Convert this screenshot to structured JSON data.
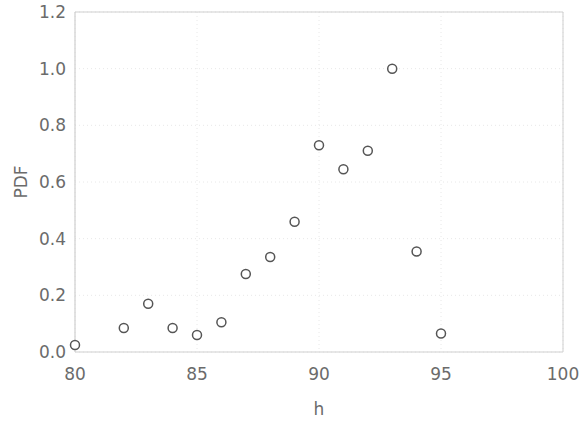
{
  "chart_data": {
    "type": "scatter",
    "title": "",
    "xlabel": "h",
    "ylabel": "PDF",
    "xlim": [
      80,
      100
    ],
    "ylim": [
      0.0,
      1.2
    ],
    "xticks": [
      80,
      85,
      90,
      95,
      100
    ],
    "yticks": [
      "0.0",
      "0.2",
      "0.4",
      "0.6",
      "0.8",
      "1.0",
      "1.2"
    ],
    "xtick_values": [
      80,
      85,
      90,
      95,
      100
    ],
    "ytick_values": [
      0.0,
      0.2,
      0.4,
      0.6,
      0.8,
      1.0,
      1.2
    ],
    "grid": true,
    "grid_style": "dotted",
    "legend": null,
    "marker": "open-circle",
    "marker_color": "#555555",
    "marker_fill": "#ffffff",
    "marker_size": 9,
    "x": [
      80,
      82,
      83,
      84,
      85,
      86,
      87,
      88,
      89,
      90,
      91,
      92,
      93,
      94,
      95
    ],
    "y": [
      0.025,
      0.085,
      0.17,
      0.085,
      0.06,
      0.105,
      0.275,
      0.335,
      0.46,
      0.73,
      0.645,
      0.71,
      1.0,
      0.355,
      0.065
    ],
    "points": [
      {
        "x": 80,
        "y": 0.025
      },
      {
        "x": 82,
        "y": 0.085
      },
      {
        "x": 83,
        "y": 0.17
      },
      {
        "x": 84,
        "y": 0.085
      },
      {
        "x": 85,
        "y": 0.06
      },
      {
        "x": 86,
        "y": 0.105
      },
      {
        "x": 87,
        "y": 0.275
      },
      {
        "x": 88,
        "y": 0.335
      },
      {
        "x": 89,
        "y": 0.46
      },
      {
        "x": 90,
        "y": 0.73
      },
      {
        "x": 91,
        "y": 0.645
      },
      {
        "x": 92,
        "y": 0.71
      },
      {
        "x": 93,
        "y": 1.0
      },
      {
        "x": 94,
        "y": 0.355
      },
      {
        "x": 95,
        "y": 0.065
      }
    ]
  },
  "axes": {
    "x_title": "h",
    "y_title": "PDF",
    "x_tick_labels": [
      "80",
      "85",
      "90",
      "95",
      "100"
    ],
    "y_tick_labels": [
      "0.0",
      "0.2",
      "0.4",
      "0.6",
      "0.8",
      "1.0",
      "1.2"
    ]
  },
  "colors": {
    "marker_stroke": "#555555",
    "marker_fill": "#ffffff",
    "grid": "#e8e8e8",
    "axis": "#cfcfcf",
    "text": "#6b6b6b",
    "background": "#ffffff"
  }
}
